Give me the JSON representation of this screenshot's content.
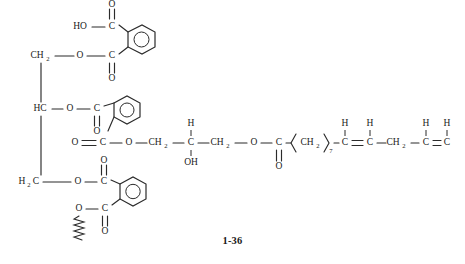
{
  "figure": {
    "caption": "1-36",
    "kind": "chemical-structure",
    "line_color": "#2b2b2b",
    "background_color": "#ffffff"
  },
  "labels": {
    "ho": "HO",
    "o": "O",
    "oh": "OH",
    "c": "C",
    "h": "H",
    "hc": "HC",
    "ch2": "CH",
    "ch2_sub": "2",
    "h2c_h": "H",
    "h2c_sub": "2",
    "h2c_c": "C",
    "ch3": "CH",
    "ch3_sub": "3",
    "double_bond_eq": "=",
    "sub_7": "7",
    "sub_4": "4"
  },
  "groups": {
    "glycerol_top": "CH2",
    "glycerol_mid": "HC",
    "glycerol_bottom": "H2C",
    "top_acid": "HO-C(=O)",
    "ester_linkage": "O-C(=O)",
    "hydroxy_propyl": "O-CH2-C(H)(OH)-CH2-O",
    "fatty_chain_a": "(CH2)7",
    "fatty_chain_b": "CH=CH",
    "fatty_chain_c": "CH2",
    "fatty_chain_d": "CH=CH",
    "fatty_chain_e": "(CH2)4CH3"
  },
  "atoms": {
    "ch2_top": {
      "x": 40,
      "y": 56,
      "text": "CH",
      "sub": "2"
    },
    "o_top_ester": {
      "x": 72,
      "y": 56,
      "text": "O"
    },
    "c_top_ester": {
      "x": 97,
      "y": 56,
      "text": "C"
    },
    "o_top_ester_dbl": {
      "x": 97,
      "y": 78,
      "text": "O"
    },
    "ho_top": {
      "x": 72,
      "y": 27,
      "text": "HO"
    },
    "c_top_acid": {
      "x": 97,
      "y": 27,
      "text": "C"
    },
    "o_top_acid_dbl": {
      "x": 97,
      "y": 9,
      "text": "O"
    },
    "hc_mid": {
      "x": 26,
      "y": 109,
      "text": "HC"
    },
    "o_mid_ester": {
      "x": 50,
      "y": 109,
      "text": "O"
    },
    "c_mid_ester": {
      "x": 74,
      "y": 109,
      "text": "C"
    },
    "o_mid_ester_dbl": {
      "x": 74,
      "y": 129,
      "text": "O"
    },
    "o_mid_lower_dbl": {
      "x": 70,
      "y": 143,
      "text": "O"
    },
    "c_mid_lower": {
      "x": 93,
      "y": 143,
      "text": "C"
    },
    "o_mid_lower_link": {
      "x": 118,
      "y": 143,
      "text": "O"
    },
    "h2c_bottom": {
      "x": 28,
      "y": 182,
      "text": "H2C"
    },
    "o_bot_ester": {
      "x": 70,
      "y": 182,
      "text": "O"
    },
    "c_bot_ester": {
      "x": 93,
      "y": 182,
      "text": "C"
    },
    "o_bot_ester_dbl": {
      "x": 93,
      "y": 160,
      "text": "O"
    },
    "o_bot_lower": {
      "x": 73,
      "y": 209,
      "text": "O"
    },
    "c_bot_lower": {
      "x": 95,
      "y": 209,
      "text": "C"
    },
    "o_bot_lower_dbl": {
      "x": 118,
      "y": 209,
      "text": "O"
    },
    "ch2_a": {
      "x": 143,
      "y": 143,
      "text": "CH",
      "sub": "2"
    },
    "c_carbinol": {
      "x": 172,
      "y": 143,
      "text": "C"
    },
    "h_carbinol": {
      "x": 172,
      "y": 124,
      "text": "H"
    },
    "oh_carbinol": {
      "x": 172,
      "y": 163,
      "text": "OH"
    },
    "ch2_b": {
      "x": 199,
      "y": 143,
      "text": "CH",
      "sub": "2"
    },
    "o_fatty_ester": {
      "x": 224,
      "y": 143,
      "text": "O"
    },
    "c_fatty_ester": {
      "x": 246,
      "y": 143,
      "text": "C"
    },
    "o_fatty_ester_dbl": {
      "x": 246,
      "y": 165,
      "text": "O"
    },
    "ch2_chain7": {
      "x": 280,
      "y": 143,
      "text": "CH",
      "sub": "2"
    },
    "c_alkene1": {
      "x": 312,
      "y": 143,
      "text": "C"
    },
    "h_alkene1": {
      "x": 312,
      "y": 124,
      "text": "H"
    },
    "c_alkene2": {
      "x": 338,
      "y": 143,
      "text": "C"
    },
    "h_alkene2": {
      "x": 338,
      "y": 124,
      "text": "H"
    },
    "ch2_mid_chain": {
      "x": 365,
      "y": 143,
      "text": "CH",
      "sub": "2"
    },
    "c_alkene3": {
      "x": 392,
      "y": 143,
      "text": "C"
    },
    "h_alkene3": {
      "x": 392,
      "y": 124,
      "text": "H"
    },
    "c_alkene4": {
      "x": 415,
      "y": 143,
      "text": "C"
    },
    "h_alkene4": {
      "x": 415,
      "y": 124,
      "text": "H"
    },
    "ch2_chain4": {
      "x": 413,
      "y": 143,
      "text": "CH",
      "sub": "2"
    },
    "ch3_terminal": {
      "x": 445,
      "y": 143,
      "text": "CH",
      "sub": "3"
    }
  }
}
